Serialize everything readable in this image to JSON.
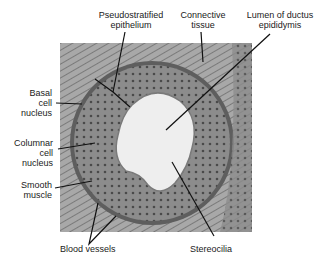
{
  "figure": {
    "labels": {
      "pseudostratified": [
        "Pseudostratified",
        "epithelium"
      ],
      "connective": [
        "Connective",
        "tissue"
      ],
      "lumen": [
        "Lumen of ductus",
        "epididymis"
      ],
      "basal": [
        "Basal",
        "cell",
        "nucleus"
      ],
      "columnar": [
        "Columnar",
        "cell",
        "nucleus"
      ],
      "smooth": [
        "Smooth",
        "muscle"
      ],
      "blood": "Blood vessels",
      "stereocilia": "Stereocilia"
    },
    "colors": {
      "background": "#ffffff",
      "text": "#1a1a1a",
      "leader_lines": "#111111"
    }
  }
}
